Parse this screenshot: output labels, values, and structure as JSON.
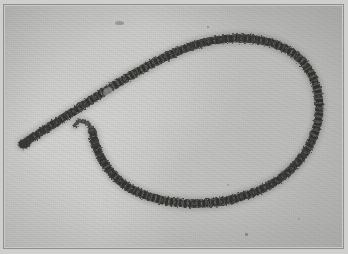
{
  "figure": {
    "kind": "photographic-plate",
    "medium": "monochrome halftone micrograph",
    "subject_label": "filamentous specimen forming an open loop",
    "alt_text": "Grayscale micrograph of a long dark segmented filament curved into a large open loop, with a thicker tail running to the upper left and a slender hooked free end near the centre",
    "frame_label": "plate border rule",
    "background_label": "photographic field"
  },
  "palette": {
    "paper": "#cfd0cd",
    "field_light": "#cbccc9",
    "field_mid": "#c6c7c4",
    "field_dark": "#bfc0bd",
    "frame_rule": "#8e908c",
    "filament_dark": "#3a3a38",
    "filament_mid": "#4e4f4b",
    "filament_light": "#6d6e69",
    "speck": "#575854"
  },
  "geometry": {
    "canvas": {
      "width": 348,
      "height": 254
    },
    "frame": {
      "x": 3,
      "y": 4,
      "width": 341,
      "height": 245,
      "rule_width": 1
    },
    "filament": {
      "stroke_width_tail": 9.5,
      "stroke_width_body": 8.5,
      "stroke_width_tip": 4.5,
      "main_path": "M 22 144 C 34 136, 52 125, 74 111 C 104 91, 140 68, 176 52 C 212 36, 250 33, 279 44 C 306 54, 321 77, 322 104 C 323 132, 309 159, 285 177 C 258 197, 222 206, 186 204 C 152 202, 124 190, 109 170 C 99 157, 94 143, 92 131",
      "hook_path": "M 92 131 C 90 125, 86 121, 81 121 C 78 121, 76 123, 75 126"
    },
    "specks": [
      {
        "name": "artifact-scratch-top",
        "x": 113,
        "y": 19,
        "width": 9,
        "height": 4,
        "opacity": 0.38
      },
      {
        "name": "artifact-dot-upper",
        "x": 205,
        "y": 24,
        "width": 2,
        "height": 2,
        "opacity": 0.45
      },
      {
        "name": "artifact-dot-lower",
        "x": 243,
        "y": 231,
        "width": 3,
        "height": 3,
        "opacity": 0.55
      },
      {
        "name": "artifact-dot-mid",
        "x": 225,
        "y": 182,
        "width": 2,
        "height": 2,
        "opacity": 0.3
      },
      {
        "name": "artifact-dot-right",
        "x": 296,
        "y": 216,
        "width": 2,
        "height": 2,
        "opacity": 0.25
      }
    ]
  }
}
